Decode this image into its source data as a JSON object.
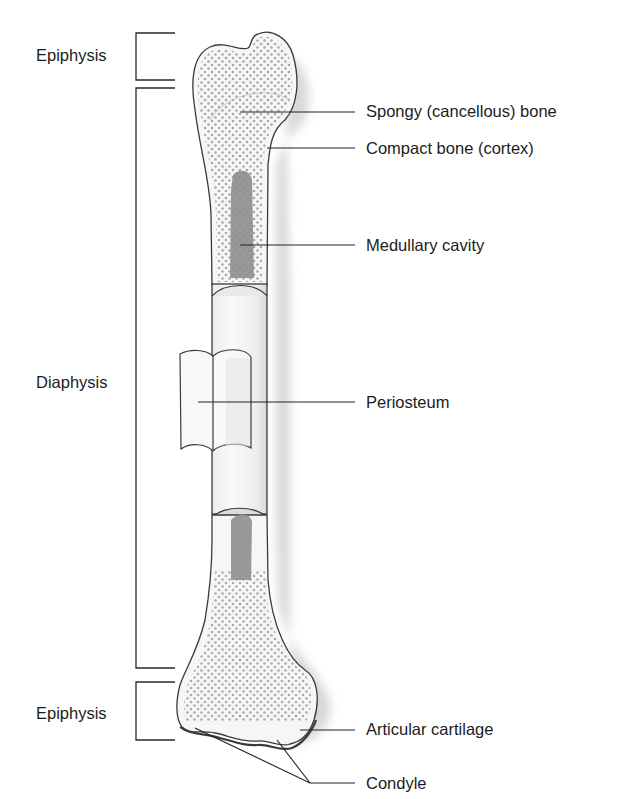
{
  "diagram": {
    "regions": [
      {
        "id": "epiphysis-top",
        "label": "Epiphysis"
      },
      {
        "id": "diaphysis",
        "label": "Diaphysis"
      },
      {
        "id": "epiphysis-bottom",
        "label": "Epiphysis"
      }
    ],
    "parts": [
      {
        "id": "spongy-bone",
        "label": "Spongy (cancellous) bone"
      },
      {
        "id": "compact-bone",
        "label": "Compact bone (cortex)"
      },
      {
        "id": "medullary-cavity",
        "label": "Medullary cavity"
      },
      {
        "id": "periosteum",
        "label": "Periosteum"
      },
      {
        "id": "articular-cartilage",
        "label": "Articular cartilage"
      },
      {
        "id": "condyle",
        "label": "Condyle"
      }
    ],
    "colors": {
      "outline": "#3a3a3a",
      "bone_fill": "#f4f4f2",
      "dots": "#9a9a9a",
      "marrow": "#8e8e8e",
      "shadow": "#cfcfcf",
      "line": "#222222"
    }
  }
}
